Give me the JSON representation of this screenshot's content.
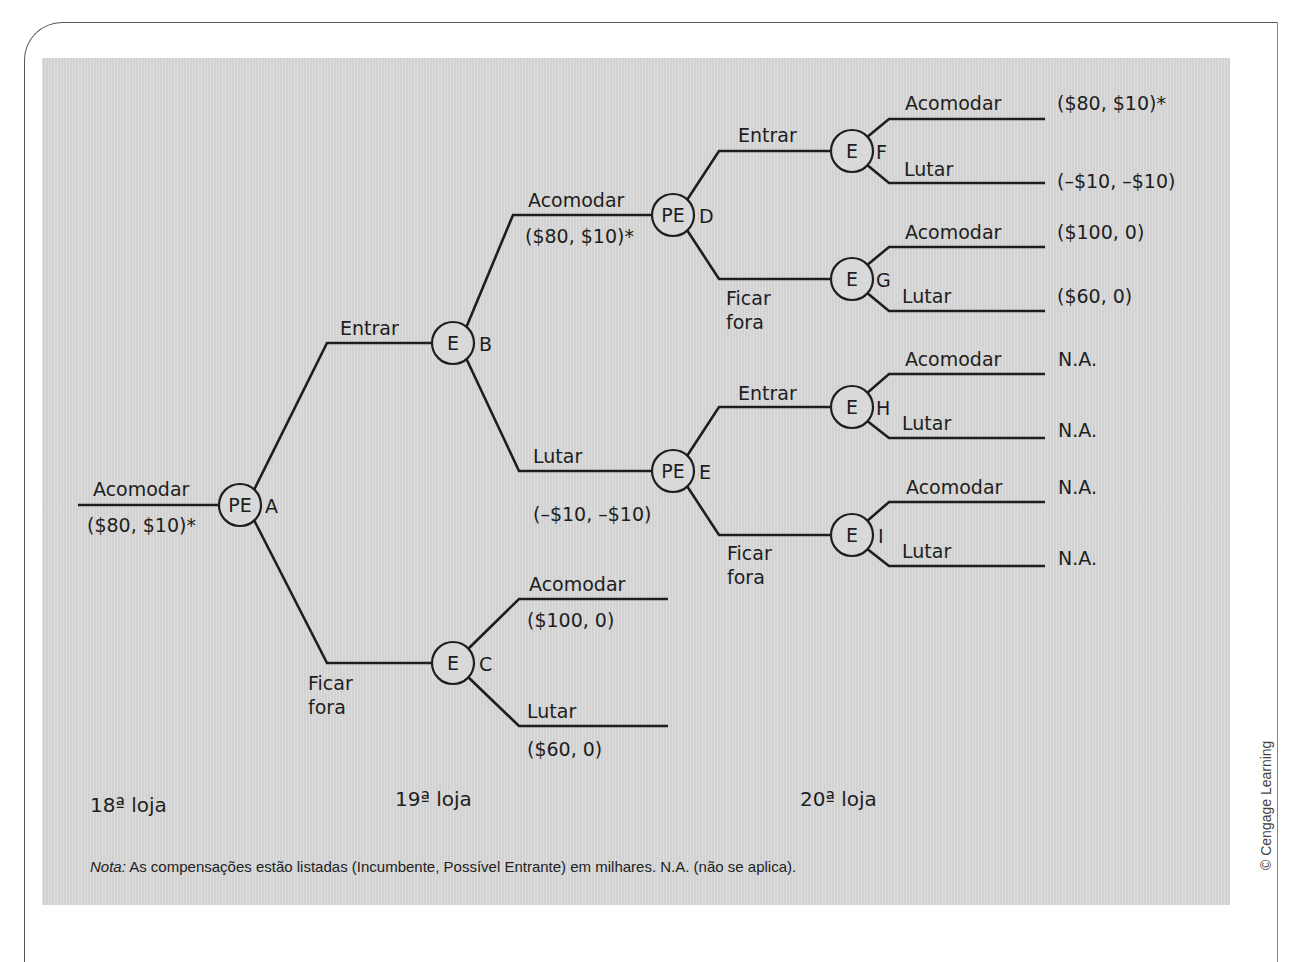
{
  "figure": {
    "note_prefix": "Nota:",
    "note_text": " As compensações estão listadas (Incumbente, Possível Entrante) em milhares. N.A. (não se aplica).",
    "credit": "© Cengage Learning",
    "stages": [
      "18ª loja",
      "19ª loja",
      "20ª loja"
    ],
    "caption_visible": ""
  },
  "tree": {
    "root_branch": {
      "label": "Acomodar",
      "payoff": "($80, $10)*"
    },
    "nodes": [
      {
        "id": "A",
        "player": "PE"
      },
      {
        "id": "B",
        "player": "E"
      },
      {
        "id": "C",
        "player": "E"
      },
      {
        "id": "D",
        "player": "PE"
      },
      {
        "id": "E",
        "player": "PE"
      },
      {
        "id": "F",
        "player": "E"
      },
      {
        "id": "G",
        "player": "E"
      },
      {
        "id": "H",
        "player": "E"
      },
      {
        "id": "I",
        "player": "E"
      }
    ],
    "edges": {
      "A_B": "Entrar",
      "A_C": {
        "l1": "Ficar",
        "l2": "fora"
      },
      "B_D": {
        "label": "Acomodar",
        "payoff": "($80, $10)*"
      },
      "B_E": {
        "label": "Lutar",
        "payoff": "(–$10, –$10)"
      },
      "C_acc": {
        "label": "Acomodar",
        "payoff": "($100, 0)"
      },
      "C_fight": {
        "label": "Lutar",
        "payoff": "($60, 0)"
      },
      "D_F": "Entrar",
      "D_G": {
        "l1": "Ficar",
        "l2": "fora"
      },
      "E_H": "Entrar",
      "E_I": {
        "l1": "Ficar",
        "l2": "fora"
      },
      "F_acc": {
        "label": "Acomodar",
        "payoff": "($80, $10)*"
      },
      "F_fight": {
        "label": "Lutar",
        "payoff": "(–$10, –$10)"
      },
      "G_acc": {
        "label": "Acomodar",
        "payoff": "($100, 0)"
      },
      "G_fight": {
        "label": "Lutar",
        "payoff": "($60, 0)"
      },
      "H_acc": {
        "label": "Acomodar",
        "payoff": "N.A."
      },
      "H_fight": {
        "label": "Lutar",
        "payoff": "N.A."
      },
      "I_acc": {
        "label": "Acomodar",
        "payoff": "N.A."
      },
      "I_fight": {
        "label": "Lutar",
        "payoff": "N.A."
      }
    }
  },
  "colors": {
    "panel": "#d9d9d9",
    "ink": "#1e1e1e",
    "page": "#ffffff"
  }
}
